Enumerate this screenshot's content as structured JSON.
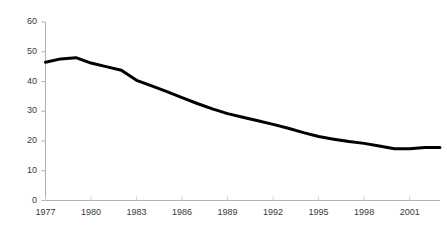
{
  "chart_data": {
    "type": "line",
    "title": "",
    "subtitle": "",
    "xlabel": "",
    "ylabel": "",
    "xlim": [
      1977,
      2003
    ],
    "ylim": [
      0,
      60
    ],
    "ytick_values": [
      0,
      10,
      20,
      30,
      40,
      50,
      60
    ],
    "ytick_labels": [
      "0",
      "10",
      "20",
      "30",
      "40",
      "50",
      "60"
    ],
    "xtick_values": [
      1977,
      1980,
      1983,
      1986,
      1989,
      1992,
      1995,
      1998,
      2001
    ],
    "xtick_labels": [
      "1977",
      "1980",
      "1983",
      "1986",
      "1989",
      "1992",
      "1995",
      "1998",
      "2001"
    ],
    "grid": false,
    "legend": "none",
    "line_color": "#000000",
    "line_width": 3,
    "axis_color": "#b0b0b0",
    "tick_label_color": "#3a3a3a",
    "series": [
      {
        "name": "series-1",
        "x": [
          1977,
          1978,
          1979,
          1980,
          1981,
          1982,
          1983,
          1984,
          1985,
          1986,
          1987,
          1988,
          1989,
          1990,
          1991,
          1992,
          1993,
          1994,
          1995,
          1996,
          1997,
          1998,
          1999,
          2000,
          2001,
          2002,
          2003
        ],
        "values": [
          46.5,
          47.6,
          48.0,
          46.2,
          45.0,
          43.8,
          40.4,
          38.5,
          36.6,
          34.6,
          32.6,
          30.8,
          29.2,
          28.0,
          26.8,
          25.6,
          24.3,
          22.8,
          21.5,
          20.6,
          19.8,
          19.2,
          18.3,
          17.4,
          17.4,
          17.8,
          17.8
        ]
      }
    ]
  },
  "axes": {
    "y_axis_name": "y-axis",
    "x_axis_name": "x-axis"
  }
}
